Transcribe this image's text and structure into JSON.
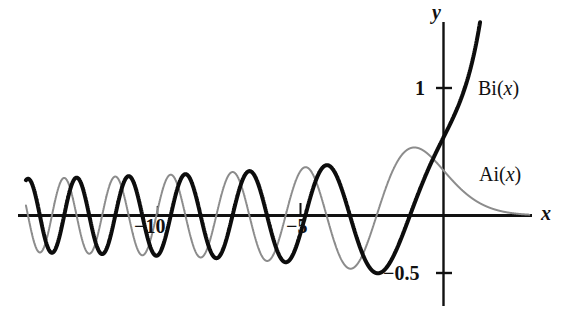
{
  "figure": {
    "title": "",
    "background": "#ffffff"
  },
  "chart_data": {
    "type": "line",
    "title": "",
    "xlabel": "x",
    "ylabel": "y",
    "xlim": [
      -14.6,
      3.0
    ],
    "ylim": [
      -0.72,
      1.55
    ],
    "grid": false,
    "legend": "inline-annotation",
    "axes": {
      "x_axis_label": "x",
      "y_axis_label": "y",
      "x_ticks": [
        -10,
        -5
      ],
      "x_tick_labels": [
        "−10",
        "−5"
      ],
      "y_ticks": [
        1,
        -0.5
      ],
      "y_tick_labels": [
        "1",
        "−0.5"
      ],
      "origin": [
        0,
        0
      ]
    },
    "series": [
      {
        "name": "Ai(x)",
        "label": "Ai(x)",
        "color": "#8c8c8c",
        "linewidth": 2,
        "style": "thin-gray",
        "annotation": "Ai(x)",
        "description": "Airy function of the first kind; oscillatory and decaying in amplitude for x<0, monotonically decaying toward 0 for x>0",
        "key_points": [
          {
            "x": -1.019,
            "y": 0.5357,
            "note": "first maximum"
          },
          {
            "x": 0.0,
            "y": 0.355,
            "note": "Ai(0)"
          },
          {
            "x": -2.338,
            "y": 0.0,
            "note": "first zero"
          },
          {
            "x": -4.088,
            "y": 0.0,
            "note": "second zero"
          },
          {
            "x": -5.521,
            "y": 0.0,
            "note": "third zero"
          },
          {
            "x": -6.787,
            "y": 0.0,
            "note": "fourth zero"
          },
          {
            "x": -7.944,
            "y": 0.0,
            "note": "fifth zero"
          },
          {
            "x": -9.023,
            "y": 0.0,
            "note": "sixth zero"
          },
          {
            "x": -10.04,
            "y": 0.0,
            "note": "seventh zero"
          },
          {
            "x": -11.009,
            "y": 0.0,
            "note": "eighth zero"
          },
          {
            "x": -11.936,
            "y": 0.0,
            "note": "ninth zero"
          },
          {
            "x": -12.829,
            "y": 0.0,
            "note": "tenth zero"
          },
          {
            "x": 3.0,
            "y": 0.0065,
            "note": "right edge, nearly zero"
          }
        ]
      },
      {
        "name": "Bi(x)",
        "label": "Bi(x)",
        "color": "#0d0d0d",
        "linewidth": 4,
        "style": "thick-black",
        "annotation": "Bi(x)",
        "description": "Airy function of the second kind; oscillatory for x<0, grows rapidly for x>0",
        "key_points": [
          {
            "x": 0.0,
            "y": 0.6149,
            "note": "Bi(0)"
          },
          {
            "x": -1.174,
            "y": -0.4529,
            "note": "minimum near x=-1.2"
          },
          {
            "x": -1.174,
            "y": 0.0,
            "note": "first zero"
          },
          {
            "x": -3.271,
            "y": 0.0,
            "note": "second zero"
          },
          {
            "x": -4.83,
            "y": 0.0,
            "note": "third zero"
          },
          {
            "x": -6.17,
            "y": 0.0,
            "note": "fourth zero"
          },
          {
            "x": -7.376,
            "y": 0.0,
            "note": "fifth zero"
          },
          {
            "x": -8.493,
            "y": 0.0,
            "note": "sixth zero"
          },
          {
            "x": -9.541,
            "y": 0.0,
            "note": "seventh zero"
          },
          {
            "x": -10.537,
            "y": 0.0,
            "note": "eighth zero"
          },
          {
            "x": -11.488,
            "y": 0.0,
            "note": "ninth zero"
          },
          {
            "x": -12.402,
            "y": 0.0,
            "note": "tenth zero"
          },
          {
            "x": 0.83,
            "y": 1.55,
            "note": "clipped at top of plot"
          }
        ]
      }
    ]
  },
  "annotations": {
    "bi_label": "Bi(",
    "bi_label_var": "x",
    "bi_label_end": ")",
    "ai_label": "Ai(",
    "ai_label_var": "x",
    "ai_label_end": ")",
    "x_axis_label": "x",
    "y_axis_label": "y",
    "tick_1": "1",
    "tick_minus_half": "−0.5",
    "tick_minus_5": "−5",
    "tick_minus_10": "−10"
  },
  "colors": {
    "ai_curve": "#8c8c8c",
    "bi_curve": "#0d0d0d",
    "axis": "#111111",
    "text": "#111111",
    "background": "#ffffff"
  }
}
